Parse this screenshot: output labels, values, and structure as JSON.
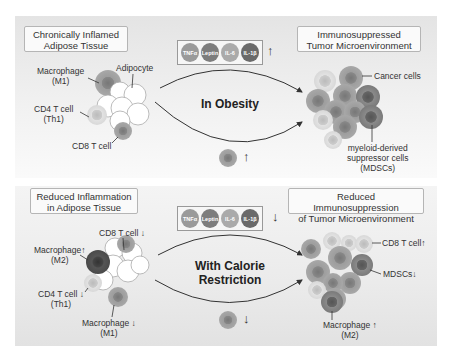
{
  "top": {
    "left_title": "Chronically Inflamed\nAdipose Tissue",
    "right_title": "Immunosuppressed\nTumor Microenvironment",
    "center_label": "In Obesity",
    "cytokines": [
      "TNFα",
      "Leptin",
      "IL-6",
      "IL-1β"
    ],
    "cytokine_direction": "↑",
    "cell_direction": "↑",
    "labels": {
      "macrophage": "Macrophage\n(M1)",
      "adipocyte": "Adipocyte",
      "cd4": "CD4 T cell\n(Th1)",
      "cd8": "CD8 T cell",
      "cancer": "Cancer cells",
      "mdsc": "myeloid-derived\nsuppressor cells\n(MDSCs)"
    }
  },
  "bottom": {
    "left_title": "Reduced Inflammation\nin Adipose Tissue",
    "right_title": "Reduced Immunosuppression\nof Tumor Microenvironment",
    "center_label": "With Calorie\nRestriction",
    "cytokines": [
      "TNFα",
      "Leptin",
      "IL-6",
      "IL-1β"
    ],
    "cytokine_direction": "↓",
    "cell_direction": "↓",
    "labels": {
      "cd8": "CD8 T cell ↓",
      "macrophage_m2": "Macrophage↑\n(M2)",
      "cd4": "CD4 T cell ↓\n(Th1)",
      "macrophage_m1": "Macrophage ↓\n(M1)",
      "cd8_tumor": "CD8 T cell↑",
      "mdsc": "MDSCs↓",
      "macrophage_tumor": "Macrophage ↑\n(M2)"
    }
  },
  "colors": {
    "cytokine_tnf": "#9a9a9a",
    "cytokine_leptin": "#7d7d7d",
    "cytokine_il6": "#aaaaaa",
    "cytokine_il1b": "#6a6a6a",
    "cancer_cell": "#8c8c8c",
    "mdsc": "#6f6f6f"
  }
}
